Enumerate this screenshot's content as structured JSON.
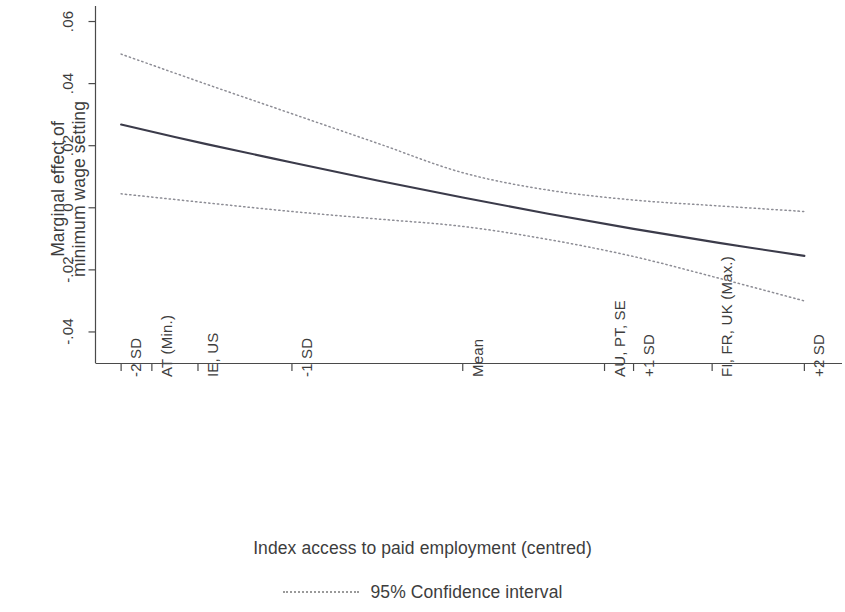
{
  "chart_data": {
    "type": "line",
    "title": "",
    "xlabel": "Index access to paid employment (centred)",
    "ylabel": "Marginal effect of\nminimum wage setting",
    "ylim": [
      -0.05,
      0.065
    ],
    "xlim": [
      -2.15,
      2.15
    ],
    "grid": false,
    "legend_position": "bottom-center",
    "ytick_labels": [
      ".06",
      ".04",
      ".02",
      "0",
      "-.02",
      "-.04"
    ],
    "ytick_values": [
      0.06,
      0.04,
      0.02,
      0,
      -0.02,
      -0.04
    ],
    "xtick_labels": [
      "-2 SD",
      "AT (Min.)",
      "IE, US",
      "-1 SD",
      "Mean",
      "AU, PT, SE",
      "+1 SD",
      "FI, FR, UK (Max.)",
      "+2 SD"
    ],
    "xtick_values": [
      -2.0,
      -1.82,
      -1.55,
      -1.0,
      0.0,
      0.83,
      1.0,
      1.46,
      2.0
    ],
    "x": [
      -2.0,
      -1.5,
      -1.0,
      -0.5,
      0.0,
      0.5,
      1.0,
      1.5,
      2.0
    ],
    "series": [
      {
        "name": "Marginal effect",
        "style": "solid",
        "color": "#3b3b4a",
        "values": [
          0.0268,
          0.0205,
          0.0146,
          0.0088,
          0.0033,
          -0.0019,
          -0.0068,
          -0.0113,
          -0.0155
        ]
      },
      {
        "name": "95% Confidence interval (upper)",
        "style": "dotted",
        "color": "#8d8d95",
        "values": [
          0.0495,
          0.0398,
          0.0303,
          0.0208,
          0.0113,
          0.0057,
          0.0025,
          0.0006,
          -0.0012
        ]
      },
      {
        "name": "95% Confidence interval (lower)",
        "style": "dotted",
        "color": "#8d8d95",
        "values": [
          0.0045,
          0.0016,
          -0.0012,
          -0.0036,
          -0.006,
          -0.0102,
          -0.0157,
          -0.0227,
          -0.03
        ]
      }
    ],
    "legend": [
      {
        "label": "95% Confidence interval",
        "style": "dotted",
        "color": "#8d8d95"
      }
    ]
  },
  "axes": {
    "y_title": "Marginal effect of\nminimum wage setting",
    "x_title": "Index access to paid employment (centred)",
    "y_ticks": [
      {
        "label": ".06"
      },
      {
        "label": ".04"
      },
      {
        "label": ".02"
      },
      {
        "label": "0"
      },
      {
        "label": "-.02"
      },
      {
        "label": "-.04"
      }
    ],
    "x_ticks": [
      {
        "label": "-2 SD"
      },
      {
        "label": "AT (Min.)"
      },
      {
        "label": "IE, US"
      },
      {
        "label": "-1 SD"
      },
      {
        "label": "Mean"
      },
      {
        "label": "AU, PT, SE"
      },
      {
        "label": "+1 SD"
      },
      {
        "label": "FI, FR, UK (Max.)"
      },
      {
        "label": "+2 SD"
      }
    ]
  },
  "legend": {
    "ci_label": "95% Confidence interval"
  }
}
